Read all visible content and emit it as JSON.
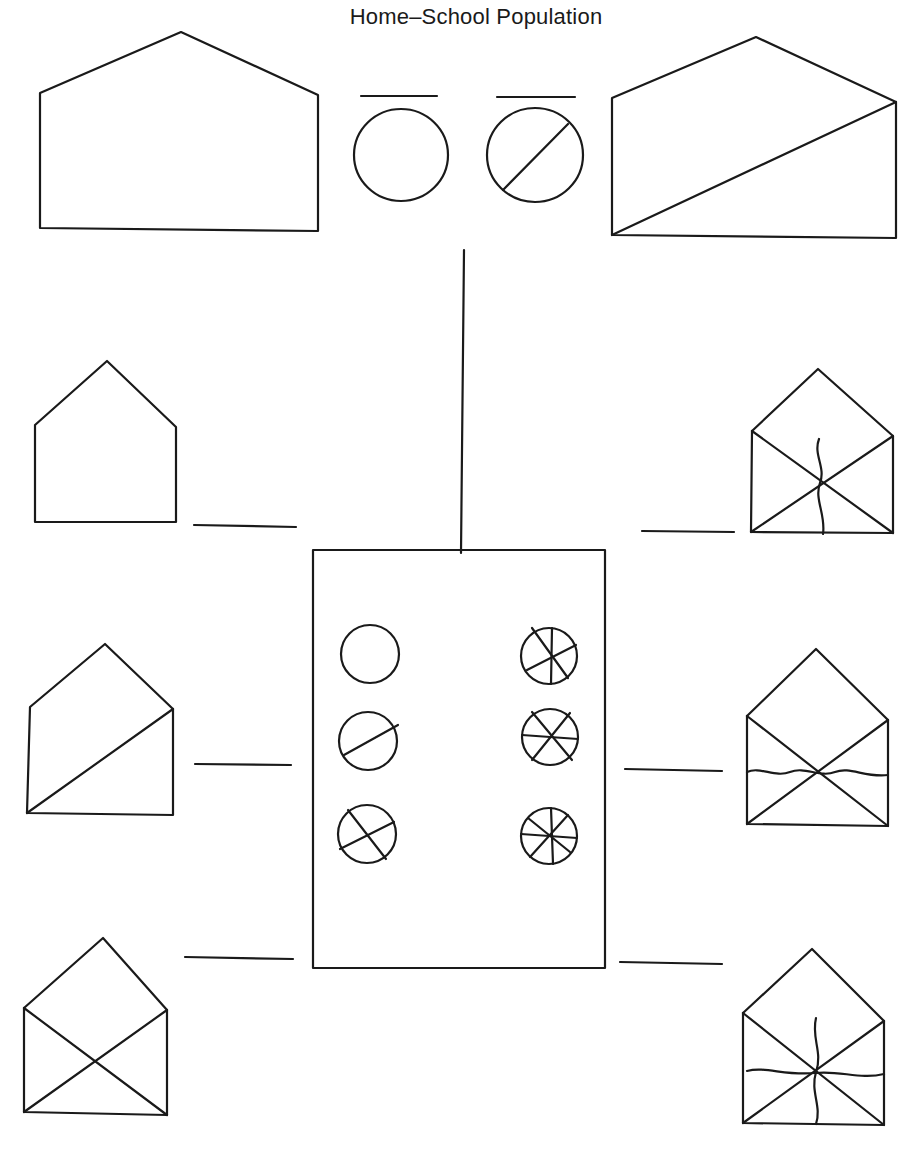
{
  "title": "Home–School Population",
  "colors": {
    "ink": "#1a1a1a",
    "paper": "#ffffff"
  },
  "top_houses": [
    {
      "id": "large-house-left",
      "points": "40,93 181,32 318,95 318,231 40,228",
      "divider": null
    },
    {
      "id": "large-house-right",
      "points": "612,98 756,37 896,102 896,238 612,235",
      "divider": "612,235 896,102"
    }
  ],
  "top_legend": [
    {
      "id": "legend-whole",
      "blank": [
        361,
        96,
        437,
        96
      ],
      "circle": [
        401,
        155,
        47,
        46
      ],
      "lines": []
    },
    {
      "id": "legend-half",
      "blank": [
        497,
        97,
        575,
        97
      ],
      "circle": [
        535,
        155,
        48,
        47
      ],
      "lines": [
        "503,190 568,124"
      ]
    }
  ],
  "connector": "464,250 461,553",
  "school": {
    "x": 313,
    "y": 550,
    "w": 292,
    "h": 418
  },
  "school_symbols": [
    {
      "id": "school-whole",
      "cx": 370,
      "cy": 654,
      "r": 29,
      "lines": []
    },
    {
      "id": "school-half",
      "cx": 368,
      "cy": 741,
      "r": 29,
      "lines": [
        "344,755 398,725"
      ]
    },
    {
      "id": "school-quarter",
      "cx": 367,
      "cy": 834,
      "r": 29,
      "lines": [
        "340,849 394,822",
        "348,810 386,859"
      ]
    },
    {
      "id": "school-sixth",
      "cx": 549,
      "cy": 656,
      "r": 28,
      "lines": [
        "527,670 576,645",
        "532,628 568,678",
        "552,628 551,684"
      ]
    },
    {
      "id": "school-sixth-b",
      "cx": 550,
      "cy": 737,
      "r": 28,
      "lines": [
        "522,735 578,739",
        "532,712 572,760",
        "532,760 570,713"
      ]
    },
    {
      "id": "school-eighth",
      "cx": 549,
      "cy": 836,
      "r": 28,
      "lines": [
        "521,834 577,838",
        "528,818 570,852",
        "530,857 568,815",
        "551,808 553,864"
      ]
    }
  ],
  "small_houses": [
    {
      "id": "house-left-1",
      "points": "35,425 107,361 176,427 176,522 35,522",
      "lines": [],
      "wavy": [],
      "blank": [
        194,
        525,
        296,
        527
      ]
    },
    {
      "id": "house-left-2",
      "points": "30,707 105,644 173,709 173,815 27,813",
      "lines": [
        "27,813 173,709"
      ],
      "wavy": [],
      "blank": [
        195,
        764,
        291,
        765
      ]
    },
    {
      "id": "house-left-3",
      "points": "24,1008 103,938 167,1010 167,1115 24,1112",
      "lines": [
        "24,1008 167,1115",
        "24,1112 167,1010"
      ],
      "wavy": [],
      "blank": [
        185,
        957,
        293,
        959
      ]
    },
    {
      "id": "house-right-1",
      "points": "752,431 818,369 893,436 893,533 751,532",
      "lines": [
        "752,431 893,533",
        "751,532 893,436"
      ],
      "wavy": [
        "M819,439 C813,455 826,467 820,483 C814,499 826,515 823,534"
      ],
      "blank": [
        642,
        531,
        734,
        532
      ]
    },
    {
      "id": "house-right-2",
      "points": "747,716 816,649 888,720 888,826 747,824",
      "lines": [
        "747,716 888,826",
        "747,824 888,720"
      ],
      "wavy": [
        "M747,772 C760,766 775,778 790,772 C805,766 820,778 835,772 C850,766 865,778 888,775"
      ],
      "blank": [
        625,
        769,
        722,
        771
      ]
    },
    {
      "id": "house-right-3",
      "points": "743,1013 812,949 884,1021 884,1125 743,1123",
      "lines": [
        "743,1013 884,1125",
        "743,1123 884,1021"
      ],
      "wavy": [
        "M816,1018 C811,1038 823,1052 816,1072 C810,1092 822,1106 816,1124",
        "M747,1071 C765,1066 785,1076 815,1073 C840,1070 860,1080 884,1074"
      ],
      "blank": [
        620,
        962,
        722,
        964
      ]
    }
  ]
}
